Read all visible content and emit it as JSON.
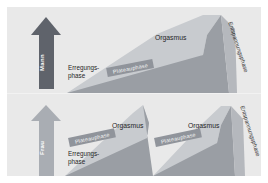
{
  "figure": {
    "background": "#ffffff",
    "panel_color": "#e9e9e9"
  },
  "colors": {
    "arrow_mann": "#5f636b",
    "arrow_frau": "#a9adb3",
    "ramp_front": "#9a9ea4",
    "ramp_top": "#c8cbcf",
    "ramp_side": "#b5b8bd",
    "plateau_band": "#90949b",
    "text": "#262626"
  },
  "rows": [
    {
      "id": "mann",
      "arrow": {
        "label": "Mann",
        "name": "arrow-mann"
      },
      "erregungsphase": "Erregungs-\nphase",
      "peaks": [
        {
          "orgasmus": "Orgasmus",
          "plateau": "Plateauphase"
        }
      ],
      "entspannungsphase": "Entspannungsphase"
    },
    {
      "id": "frau",
      "arrow": {
        "label": "Frau",
        "name": "arrow-frau"
      },
      "erregungsphase": "Erregungs-\nphase",
      "peaks": [
        {
          "orgasmus": "Orgasmus",
          "plateau": "Plateauphase"
        },
        {
          "orgasmus": "Orgasmus",
          "plateau": "Plateauphase"
        }
      ],
      "entspannungsphase": "Entspannungsphase"
    }
  ]
}
